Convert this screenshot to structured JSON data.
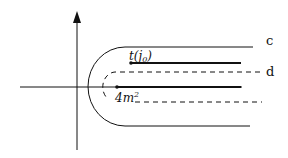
{
  "diagram": {
    "labels": {
      "contour_c": "c",
      "contour_d": "d",
      "cut_upper": "t(j",
      "cut_upper_sub": "0",
      "cut_upper_close": ")",
      "cut_lower": "4m",
      "cut_lower_sup": "2"
    },
    "colors": {
      "ink": "#111111",
      "background": "#ffffff"
    }
  }
}
